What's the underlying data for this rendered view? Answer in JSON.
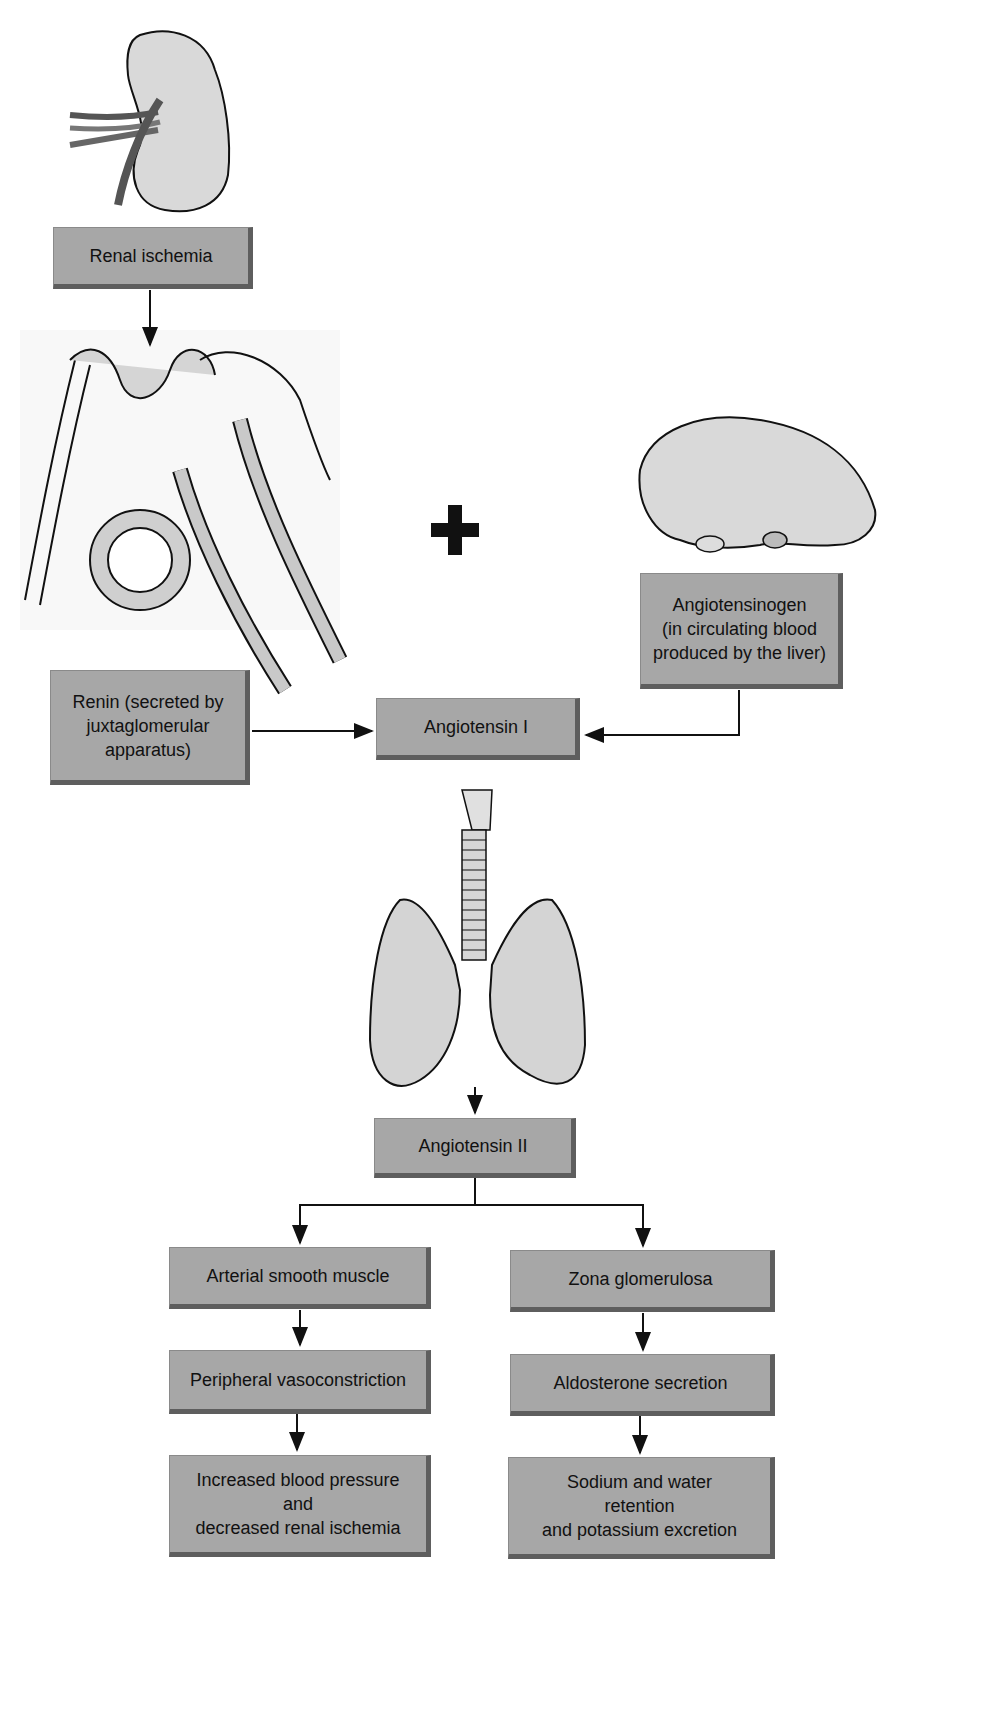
{
  "diagram": {
    "nodes": {
      "renal_ischemia": "Renal ischemia",
      "renin": "Renin (secreted by\njuxtaglomerular\napparatus)",
      "angiotensinogen": "Angiotensinogen\n(in circulating blood\nproduced by the liver)",
      "angiotensin_1": "Angiotensin I",
      "angiotensin_2": "Angiotensin II",
      "arterial_smooth_muscle": "Arterial smooth muscle",
      "peripheral_vasoconstriction": "Peripheral vasoconstriction",
      "increased_bp": "Increased blood pressure\nand\ndecreased renal ischemia",
      "zona_glomerulosa": "Zona glomerulosa",
      "aldosterone_secretion": "Aldosterone secretion",
      "sodium_water": "Sodium and water\nretention\nand potassium excretion"
    },
    "illustrations": [
      "kidney",
      "juxtaglomerular-apparatus",
      "liver",
      "lungs-and-trachea"
    ],
    "operator": "+",
    "colors": {
      "box_fill": "#a7a7a7",
      "box_bevel": "#5e5e5e",
      "line": "#111111"
    }
  }
}
